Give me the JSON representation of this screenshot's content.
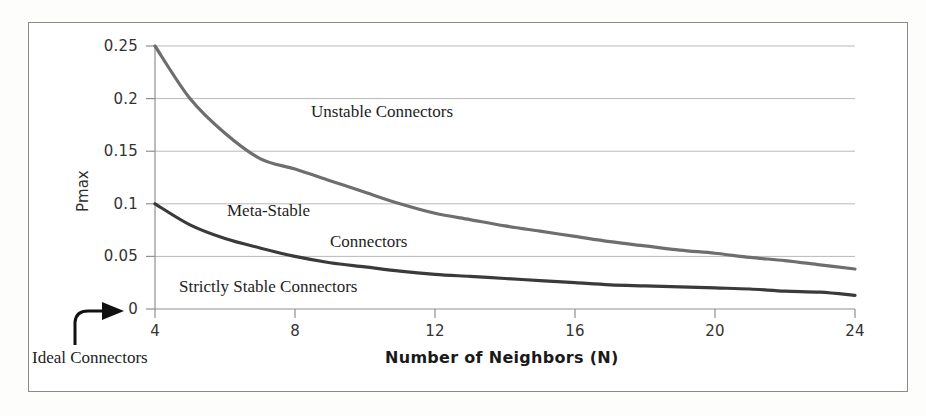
{
  "figure": {
    "background_color": "#ffffff",
    "frame_color": "#8a8a8a"
  },
  "chart_data": {
    "type": "line",
    "title": "",
    "xlabel": "Number of Neighbors (N)",
    "ylabel": "Pmax",
    "xlim": [
      4,
      24
    ],
    "ylim": [
      0,
      0.25
    ],
    "grid": "horizontal",
    "legend": "none",
    "xticks": [
      "4",
      "8",
      "12",
      "16",
      "20",
      "24"
    ],
    "xtick_values": [
      4,
      8,
      12,
      16,
      20,
      24
    ],
    "yticks": [
      "0",
      "0.05",
      "0.1",
      "0.15",
      "0.2",
      "0.25"
    ],
    "ytick_values": [
      0,
      0.05,
      0.1,
      0.15,
      0.2,
      0.25
    ],
    "x": [
      4,
      5,
      6,
      7,
      8,
      9,
      10,
      11,
      12,
      13,
      14,
      15,
      16,
      17,
      18,
      19,
      20,
      21,
      22,
      23,
      24
    ],
    "series": [
      {
        "name": "Upper boundary (unstable / meta-stable)",
        "color": "#6e6e6e",
        "width": 3.2,
        "values": [
          0.25,
          0.2,
          0.167,
          0.143,
          0.133,
          0.122,
          0.111,
          0.1,
          0.091,
          0.085,
          0.079,
          0.074,
          0.069,
          0.064,
          0.06,
          0.056,
          0.053,
          0.049,
          0.046,
          0.042,
          0.038
        ]
      },
      {
        "name": "Lower boundary (meta-stable / strictly stable)",
        "color": "#3a3a3a",
        "width": 3.2,
        "values": [
          0.1,
          0.08,
          0.067,
          0.058,
          0.05,
          0.044,
          0.04,
          0.036,
          0.033,
          0.031,
          0.029,
          0.027,
          0.025,
          0.023,
          0.022,
          0.021,
          0.02,
          0.019,
          0.017,
          0.016,
          0.013
        ]
      }
    ],
    "annotations": [
      {
        "text": "Unstable Connectors",
        "x": 12.0,
        "y": 0.188
      },
      {
        "text": "Meta-Stable",
        "x": 8.2,
        "y": 0.097
      },
      {
        "text": "Connectors",
        "x": 11.2,
        "y": 0.067
      },
      {
        "text": "Strictly Stable Connectors",
        "x": 6.8,
        "y": 0.024
      },
      {
        "text": "Ideal Connectors",
        "x": 0.0,
        "y": 0.0
      }
    ]
  },
  "labels": {
    "y_axis_title": "Pmax",
    "x_axis_title": "Number of Neighbors (N)",
    "yticks": [
      "0.25",
      "0.2",
      "0.15",
      "0.1",
      "0.05",
      "0"
    ],
    "xticks": [
      "4",
      "8",
      "12",
      "16",
      "20",
      "24"
    ],
    "region_unstable": "Unstable Connectors",
    "region_meta_stable": "Meta-Stable",
    "region_meta_stable_2": "Connectors",
    "region_strictly_stable": "Strictly Stable Connectors",
    "callout_ideal": "Ideal Connectors"
  }
}
